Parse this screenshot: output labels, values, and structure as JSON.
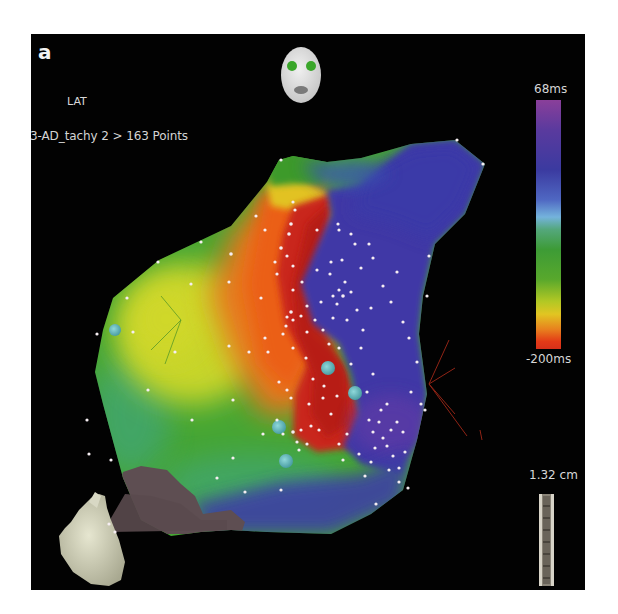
{
  "figure": {
    "panel_label": "a",
    "map_type": "LAT",
    "map_name": "3-AD_tachy 2 > 163 Points",
    "colorbar": {
      "max_label": "68ms",
      "min_label": "-200ms",
      "colors_top_to_bottom": [
        "#8a3f9a",
        "#3b3aa0",
        "#74b3dc",
        "#3d9b36",
        "#e1c522",
        "#e8821e",
        "#d7301a"
      ]
    },
    "scale": {
      "label": "1.32 cm"
    },
    "orientation_icons": [
      "face-orientation-icon",
      "heart-orientation-icon"
    ],
    "map_colors": {
      "early": "#d42a14",
      "orange": "#ea6a18",
      "yellow": "#c8d42a",
      "green": "#4aa832",
      "late": "#3f3aa8",
      "scar_gray": "#5e4e52",
      "point_marker": "#f4eef2",
      "ablation_marker": "#6ec4c8"
    }
  }
}
